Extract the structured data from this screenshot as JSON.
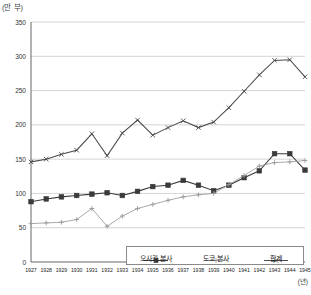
{
  "chart_data": {
    "type": "line",
    "title": "",
    "ylabel": "(만 부)",
    "xlabel": "(년)",
    "ylim": [
      0,
      350
    ],
    "yticks": [
      0,
      50,
      100,
      150,
      200,
      250,
      300,
      350
    ],
    "grid": true,
    "legend_position": "bottom-center",
    "categories": [
      "1927",
      "1928",
      "1929",
      "1930",
      "1931",
      "1932",
      "1933",
      "1934",
      "1935",
      "1936",
      "1937",
      "1938",
      "1939",
      "1940",
      "1941",
      "1942",
      "1943",
      "1944",
      "1945"
    ],
    "series": [
      {
        "name": "오사카 본사",
        "marker": "filled-square",
        "color": "#3a3a3a",
        "values": [
          88,
          92,
          95,
          97,
          99,
          101,
          97,
          103,
          110,
          112,
          119,
          112,
          104,
          112,
          123,
          133,
          158,
          158,
          134
        ]
      },
      {
        "name": "도쿄 본사",
        "marker": "cross",
        "color": "#9a9a9a",
        "values": [
          56,
          57,
          58,
          62,
          78,
          52,
          67,
          78,
          84,
          90,
          95,
          98,
          100,
          113,
          126,
          140,
          145,
          146,
          148
        ]
      },
      {
        "name": "합계",
        "marker": "x",
        "color": "#4a4a4a",
        "values": [
          146,
          150,
          157,
          163,
          187,
          155,
          188,
          207,
          185,
          196,
          206,
          196,
          204,
          225,
          249,
          273,
          294,
          295,
          270
        ]
      }
    ]
  },
  "legend": {
    "items": [
      {
        "label": "오사카 본사"
      },
      {
        "label": "도쿄 본사"
      },
      {
        "label": "합계"
      }
    ]
  },
  "footnote": {
    "text": ""
  }
}
